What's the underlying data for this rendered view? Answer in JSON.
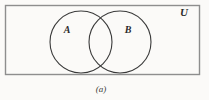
{
  "figure": {
    "kind": "venn-diagram",
    "caption": "(a)",
    "universe_label": "U",
    "sets": [
      {
        "id": "A",
        "label": "A"
      },
      {
        "id": "B",
        "label": "B"
      }
    ],
    "relation": "intersecting",
    "colors": {
      "background": "#fbfaf8",
      "rect_stroke": "#8e8e8e",
      "circle_stroke": "#3a3a3a",
      "label_text": "#2b2b2b",
      "caption_text": "#3a3a3a",
      "fill": "none"
    },
    "geometry": {
      "rect": {
        "x": 5.5,
        "y": 5.5,
        "width": 194,
        "height": 69,
        "stroke_width": 1.4
      },
      "circle_a": {
        "cx": 81,
        "cy": 42,
        "r": 31,
        "stroke_width": 1.1
      },
      "circle_b": {
        "cx": 120,
        "cy": 42,
        "r": 31,
        "stroke_width": 1.1
      },
      "label_u": {
        "x": 184,
        "y": 16,
        "font_size": 11
      },
      "label_a": {
        "x": 67,
        "y": 33,
        "font_size": 10
      },
      "label_b": {
        "x": 128,
        "y": 33,
        "font_size": 10
      },
      "caption": {
        "x": 101,
        "y": 92,
        "font_size": 9
      }
    }
  }
}
